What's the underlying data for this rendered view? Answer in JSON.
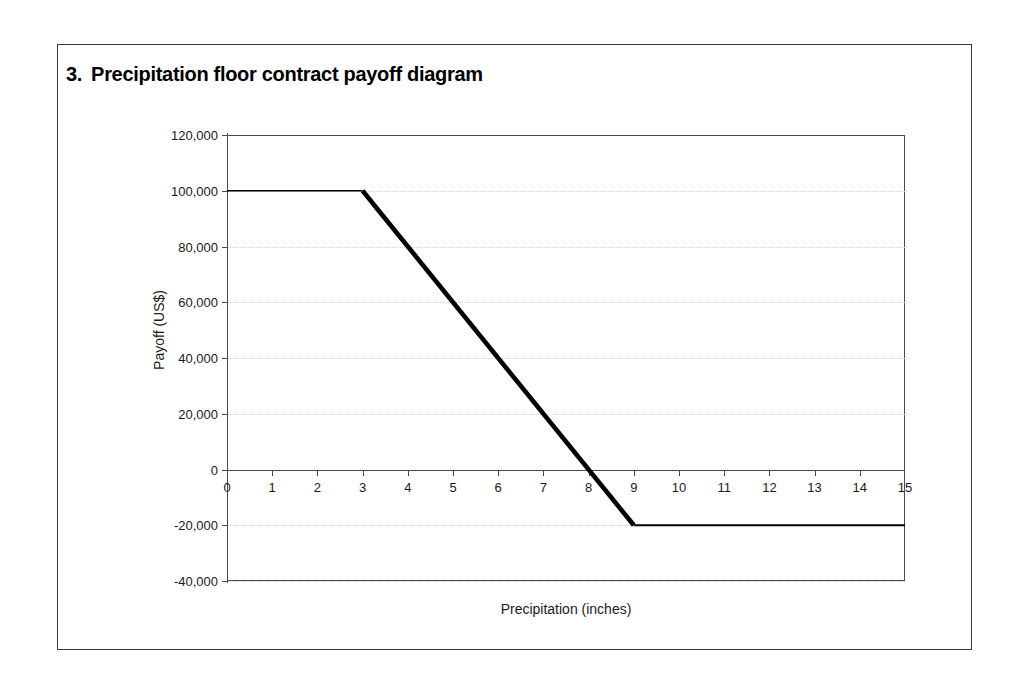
{
  "figure": {
    "number": "3.",
    "title": "Precipitation floor contract payoff diagram"
  },
  "chart_data": {
    "type": "line",
    "title": "Precipitation floor contract payoff diagram",
    "xlabel": "Precipitation (inches)",
    "ylabel": "Payoff (US$)",
    "xlim": [
      0,
      15
    ],
    "ylim": [
      -40000,
      120000
    ],
    "grid": true,
    "legend": "none",
    "x_ticks": [
      0,
      1,
      2,
      3,
      4,
      5,
      6,
      7,
      8,
      9,
      10,
      11,
      12,
      13,
      14,
      15
    ],
    "x_tick_labels": [
      "0",
      "1",
      "2",
      "3",
      "4",
      "5",
      "6",
      "7",
      "8",
      "9",
      "10",
      "11",
      "12",
      "13",
      "14",
      "15"
    ],
    "y_ticks": [
      -40000,
      -20000,
      0,
      20000,
      40000,
      60000,
      80000,
      100000,
      120000
    ],
    "y_tick_labels": [
      "-40,000",
      "-20,000",
      "0",
      "20,000",
      "40,000",
      "60,000",
      "80,000",
      "100,000",
      "120,000"
    ],
    "series": [
      {
        "name": "Payoff",
        "color": "#000000",
        "x": [
          0,
          3,
          9,
          15
        ],
        "values": [
          100000,
          100000,
          -20000,
          -20000
        ]
      }
    ],
    "breakpoints": [
      {
        "x": 3,
        "y": 100000,
        "note": "strike / cap of payoff"
      },
      {
        "x": 8,
        "y": 0,
        "note": "break-even precipitation"
      },
      {
        "x": 9,
        "y": -20000,
        "note": "maximum loss reached"
      }
    ],
    "slope_per_inch": -20000
  }
}
